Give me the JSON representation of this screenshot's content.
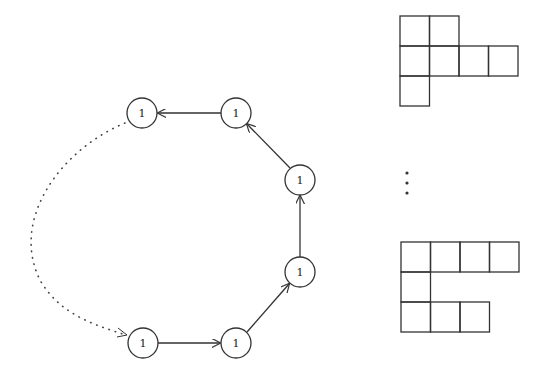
{
  "diagram": {
    "graph": {
      "nodes": [
        {
          "id": "n1",
          "label": "1",
          "x": 143,
          "y": 343
        },
        {
          "id": "n2",
          "label": "1",
          "x": 236,
          "y": 343
        },
        {
          "id": "n3",
          "label": "1",
          "x": 300,
          "y": 272
        },
        {
          "id": "n4",
          "label": "1",
          "x": 300,
          "y": 180
        },
        {
          "id": "n5",
          "label": "1",
          "x": 236,
          "y": 113
        },
        {
          "id": "n6",
          "label": "1",
          "x": 142,
          "y": 113
        }
      ],
      "edges": [
        {
          "from": "n1",
          "to": "n2",
          "style": "solid"
        },
        {
          "from": "n2",
          "to": "n3",
          "style": "solid"
        },
        {
          "from": "n3",
          "to": "n4",
          "style": "solid"
        },
        {
          "from": "n4",
          "to": "n5",
          "style": "solid"
        },
        {
          "from": "n5",
          "to": "n6",
          "style": "solid"
        },
        {
          "from": "n6",
          "to": "n1",
          "style": "dotted"
        }
      ]
    },
    "young_diagrams": [
      {
        "name": "top-diagram",
        "rows": [
          2,
          4,
          1
        ]
      },
      {
        "name": "bottom-diagram",
        "rows": [
          4,
          1,
          3
        ]
      }
    ],
    "ellipsis": "vertical-dots"
  }
}
